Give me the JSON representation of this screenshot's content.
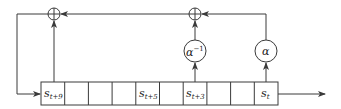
{
  "diagram": {
    "title": "",
    "type": "linear-feedback shift register over extension field",
    "register": {
      "cells": [
        {
          "name": "s_{t+9}",
          "base": "s",
          "sub": "t+9",
          "shown": true
        },
        {
          "name": "s_{t+8}",
          "base": "",
          "sub": "",
          "shown": false
        },
        {
          "name": "s_{t+7}",
          "base": "",
          "sub": "",
          "shown": false
        },
        {
          "name": "s_{t+6}",
          "base": "",
          "sub": "",
          "shown": false
        },
        {
          "name": "s_{t+5}",
          "base": "s",
          "sub": "t+5",
          "shown": true
        },
        {
          "name": "s_{t+4}",
          "base": "",
          "sub": "",
          "shown": false
        },
        {
          "name": "s_{t+3}",
          "base": "s",
          "sub": "t+3",
          "shown": true
        },
        {
          "name": "s_{t+2}",
          "base": "",
          "sub": "",
          "shown": false
        },
        {
          "name": "s_{t+1}",
          "base": "",
          "sub": "",
          "shown": false
        },
        {
          "name": "s_t",
          "base": "s",
          "sub": "t",
          "shown": true
        }
      ]
    },
    "multipliers": [
      {
        "id": "alpha-inverse",
        "label": "α",
        "sup": "−1",
        "tap": "s_{t+3}"
      },
      {
        "id": "alpha",
        "label": "α",
        "sup": "",
        "tap": "s_t"
      }
    ],
    "xor_nodes": [
      {
        "id": "xor-left",
        "symbol": "⊕"
      },
      {
        "id": "xor-middle",
        "symbol": "⊕"
      }
    ],
    "colors": {
      "stroke": "#3a3a3a",
      "background": "#ffffff"
    }
  }
}
